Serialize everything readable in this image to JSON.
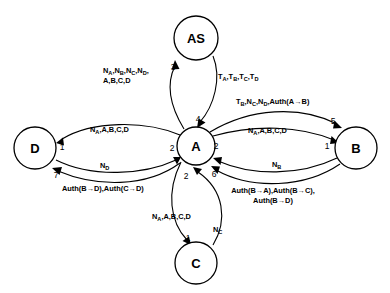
{
  "diagram": {
    "type": "protocol-message-sequence-graph",
    "nodes": [
      {
        "id": "AS",
        "label": "AS",
        "cx": 196,
        "cy": 38,
        "r": 22
      },
      {
        "id": "A",
        "label": "A",
        "cx": 196,
        "cy": 146,
        "r": 19
      },
      {
        "id": "D",
        "label": "D",
        "cx": 35,
        "cy": 148,
        "r": 21
      },
      {
        "id": "B",
        "label": "B",
        "cx": 356,
        "cy": 148,
        "r": 21
      },
      {
        "id": "C",
        "label": "C",
        "cx": 196,
        "cy": 263,
        "r": 21
      }
    ],
    "edges": [
      {
        "id": "a-to-as",
        "from": "A",
        "to": "AS",
        "step": "3",
        "step_x": 173,
        "step_y": 67,
        "label_lines": [
          "N<sub>A</sub>,N<sub>B</sub>,N<sub>C</sub>,N<sub>D</sub>,",
          "A,B,C,D"
        ],
        "label_x": 103,
        "label_y": 70,
        "align": "left"
      },
      {
        "id": "as-to-a",
        "from": "AS",
        "to": "A",
        "step": "4",
        "step_x": 198,
        "step_y": 119,
        "label_lines": [
          "T<sub>A</sub>,T<sub>B</sub>,T<sub>C</sub>,T<sub>D</sub>"
        ],
        "label_x": 218,
        "label_y": 76,
        "align": "left"
      },
      {
        "id": "a-to-b-upper",
        "from": "A",
        "to": "B",
        "step": "5",
        "step_x": 333,
        "step_y": 121,
        "label_lines": [
          "T<sub>B</sub>,N<sub>C</sub>,N<sub>D</sub>,Auth(A&#8594;B)"
        ],
        "label_x": 236,
        "label_y": 101,
        "align": "left"
      },
      {
        "id": "a-to-b-lower",
        "from": "A",
        "to": "B",
        "step": "1",
        "step_x": 327,
        "step_y": 146,
        "label_lines": [
          "N<sub>A</sub>,A,B,C,D"
        ],
        "label_x": 248,
        "label_y": 130,
        "align": "left"
      },
      {
        "id": "b-to-a-nb",
        "from": "B",
        "to": "A",
        "step": "2",
        "step_x": 216,
        "step_y": 146,
        "label_lines": [
          "N<sub>B</sub>"
        ],
        "label_x": 272,
        "label_y": 164,
        "align": "left"
      },
      {
        "id": "b-to-a-auth",
        "from": "B",
        "to": "A",
        "step": "6",
        "step_x": 214,
        "step_y": 174,
        "label_lines": [
          "Auth(B&#8594;A),Auth(B&#8594;C),",
          "Auth(B&#8594;D)"
        ],
        "label_x": 273,
        "label_y": 190,
        "align": "center"
      },
      {
        "id": "a-to-d",
        "from": "A",
        "to": "D",
        "step": "1",
        "step_x": 62,
        "step_y": 147,
        "label_lines": [
          "N<sub>A</sub>,A,B,C,D"
        ],
        "label_x": 90,
        "label_y": 129,
        "align": "left"
      },
      {
        "id": "d-to-a-nd",
        "from": "D",
        "to": "A",
        "step": "2",
        "step_x": 172,
        "step_y": 148,
        "label_lines": [
          "N<sub>D</sub>"
        ],
        "label_x": 100,
        "label_y": 165,
        "align": "left"
      },
      {
        "id": "a-to-d-auth",
        "from": "A",
        "to": "D",
        "step": "7",
        "step_x": 56,
        "step_y": 175,
        "label_lines": [
          "Auth(B&#8594;D),Auth(C&#8594;D)"
        ],
        "label_x": 62,
        "label_y": 188,
        "align": "left"
      },
      {
        "id": "a-to-c",
        "from": "A",
        "to": "C",
        "step": "1",
        "step_x": 188,
        "step_y": 238,
        "label_lines": [
          "N<sub>A</sub>,A,B,C,D"
        ],
        "label_x": 152,
        "label_y": 216,
        "align": "left"
      },
      {
        "id": "c-to-a",
        "from": "C",
        "to": "A",
        "step": "2",
        "step_x": 186,
        "step_y": 176,
        "label_lines": [
          "N<sub>C</sub>"
        ],
        "label_x": 213,
        "label_y": 229,
        "align": "left"
      }
    ],
    "colors": {
      "stroke": "#000000",
      "fill": "#ffffff",
      "text": "#000000"
    }
  }
}
